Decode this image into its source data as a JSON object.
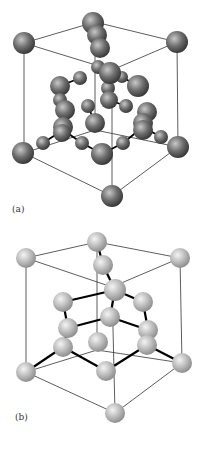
{
  "figure": {
    "panels": [
      {
        "id": "a",
        "label": "(a)",
        "sphere_color": "#6e6e6e",
        "sphere_highlight": "#c8c8c8",
        "description": "diamond-cubic unit cell, ball-and-stick, dark gray atoms",
        "edges": [
          [
            95,
            22,
            24,
            43
          ],
          [
            95,
            22,
            177,
            42
          ],
          [
            24,
            43,
            112,
            70
          ],
          [
            177,
            42,
            112,
            70
          ],
          [
            24,
            43,
            24,
            153
          ],
          [
            177,
            42,
            178,
            147
          ],
          [
            112,
            70,
            112,
            196
          ],
          [
            95,
            22,
            95,
            130
          ],
          [
            24,
            153,
            112,
            196
          ],
          [
            178,
            147,
            112,
            196
          ],
          [
            24,
            153,
            95,
            130
          ],
          [
            178,
            147,
            95,
            130
          ]
        ],
        "bonds": [
          [
            43,
            143,
            63,
            130
          ],
          [
            82,
            143,
            63,
            130
          ],
          [
            82,
            143,
            102,
            154
          ],
          [
            123,
            143,
            102,
            154
          ],
          [
            123,
            143,
            143,
            127
          ],
          [
            161,
            137,
            143,
            127
          ],
          [
            60,
            86,
            80,
            78
          ],
          [
            138,
            86,
            122,
            77
          ],
          [
            60,
            100,
            60,
            86
          ],
          [
            88,
            106,
            95,
            123
          ],
          [
            126,
            106,
            109,
            100
          ]
        ],
        "spheres": [
          {
            "x": 93,
            "y": 23,
            "r": 11
          },
          {
            "x": 97,
            "y": 35,
            "r": 10
          },
          {
            "x": 100,
            "y": 48,
            "r": 10
          },
          {
            "x": 24,
            "y": 43,
            "r": 11
          },
          {
            "x": 177,
            "y": 42,
            "r": 11
          },
          {
            "x": 98,
            "y": 67,
            "r": 7
          },
          {
            "x": 80,
            "y": 78,
            "r": 7
          },
          {
            "x": 122,
            "y": 77,
            "r": 6
          },
          {
            "x": 60,
            "y": 86,
            "r": 10
          },
          {
            "x": 138,
            "y": 86,
            "r": 11
          },
          {
            "x": 108,
            "y": 88,
            "r": 7
          },
          {
            "x": 110,
            "y": 73,
            "r": 11
          },
          {
            "x": 109,
            "y": 100,
            "r": 9
          },
          {
            "x": 60,
            "y": 100,
            "r": 7
          },
          {
            "x": 88,
            "y": 106,
            "r": 7
          },
          {
            "x": 126,
            "y": 106,
            "r": 7
          },
          {
            "x": 65,
            "y": 110,
            "r": 10
          },
          {
            "x": 147,
            "y": 112,
            "r": 10
          },
          {
            "x": 95,
            "y": 123,
            "r": 10
          },
          {
            "x": 143,
            "y": 123,
            "r": 10
          },
          {
            "x": 63,
            "y": 127,
            "r": 10
          },
          {
            "x": 62,
            "y": 133,
            "r": 9
          },
          {
            "x": 143,
            "y": 130,
            "r": 10
          },
          {
            "x": 43,
            "y": 143,
            "r": 7
          },
          {
            "x": 82,
            "y": 143,
            "r": 7
          },
          {
            "x": 123,
            "y": 143,
            "r": 7
          },
          {
            "x": 161,
            "y": 137,
            "r": 7
          },
          {
            "x": 23,
            "y": 153,
            "r": 11
          },
          {
            "x": 178,
            "y": 147,
            "r": 11
          },
          {
            "x": 102,
            "y": 154,
            "r": 11
          },
          {
            "x": 112,
            "y": 196,
            "r": 11
          }
        ]
      },
      {
        "id": "b",
        "label": "(b)",
        "sphere_color": "#bdbdbd",
        "sphere_highlight": "#f4f4f4",
        "description": "diamond-cubic unit cell, ball-and-stick, light gray atoms with thick black bonds",
        "edges": [
          [
            97,
            17,
            26,
            33
          ],
          [
            97,
            17,
            180,
            33
          ],
          [
            26,
            33,
            112,
            62
          ],
          [
            180,
            33,
            112,
            62
          ],
          [
            26,
            33,
            26,
            147
          ],
          [
            180,
            33,
            182,
            138
          ],
          [
            112,
            62,
            115,
            188
          ],
          [
            97,
            17,
            97,
            125
          ],
          [
            26,
            147,
            115,
            188
          ],
          [
            182,
            138,
            115,
            188
          ],
          [
            26,
            147,
            97,
            125
          ],
          [
            182,
            138,
            97,
            125
          ]
        ],
        "bonds": [
          [
            97,
            17,
            103,
            40
          ],
          [
            103,
            40,
            115,
            65
          ],
          [
            115,
            65,
            63,
            77
          ],
          [
            115,
            65,
            143,
            77
          ],
          [
            115,
            65,
            110,
            92
          ],
          [
            63,
            77,
            68,
            103
          ],
          [
            143,
            77,
            148,
            105
          ],
          [
            110,
            92,
            68,
            103
          ],
          [
            110,
            92,
            148,
            105
          ],
          [
            68,
            103,
            63,
            122
          ],
          [
            148,
            105,
            147,
            120
          ],
          [
            63,
            122,
            26,
            147
          ],
          [
            63,
            122,
            106,
            146
          ],
          [
            147,
            120,
            106,
            146
          ],
          [
            147,
            120,
            182,
            138
          ]
        ],
        "spheres": [
          {
            "x": 97,
            "y": 17,
            "r": 10
          },
          {
            "x": 26,
            "y": 33,
            "r": 10
          },
          {
            "x": 180,
            "y": 33,
            "r": 10
          },
          {
            "x": 103,
            "y": 40,
            "r": 10
          },
          {
            "x": 63,
            "y": 77,
            "r": 10
          },
          {
            "x": 143,
            "y": 77,
            "r": 10
          },
          {
            "x": 110,
            "y": 92,
            "r": 10
          },
          {
            "x": 115,
            "y": 65,
            "r": 11
          },
          {
            "x": 68,
            "y": 103,
            "r": 10
          },
          {
            "x": 148,
            "y": 105,
            "r": 10
          },
          {
            "x": 98,
            "y": 117,
            "r": 10
          },
          {
            "x": 63,
            "y": 122,
            "r": 10
          },
          {
            "x": 147,
            "y": 120,
            "r": 10
          },
          {
            "x": 26,
            "y": 147,
            "r": 10
          },
          {
            "x": 182,
            "y": 138,
            "r": 10
          },
          {
            "x": 106,
            "y": 146,
            "r": 10
          },
          {
            "x": 115,
            "y": 188,
            "r": 10
          }
        ]
      }
    ]
  }
}
